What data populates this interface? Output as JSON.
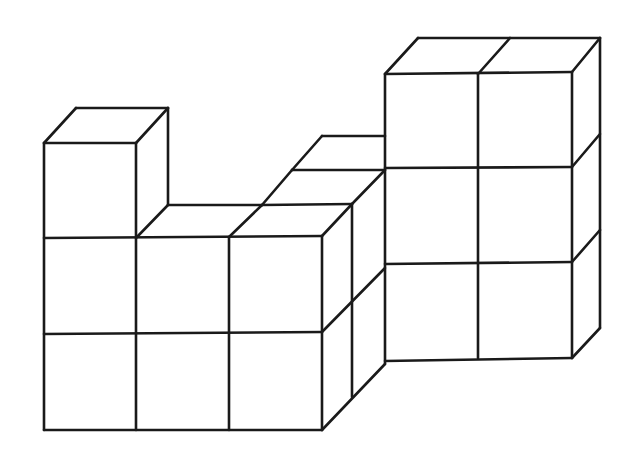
{
  "figure": {
    "stroke_color": "#1a1a1a",
    "fill_color": "#ffffff",
    "stroke_width": 2.6,
    "front_left_block": {
      "columns": 3,
      "rows": 2,
      "tower_on_left_column": 1
    },
    "middle_back_step": {
      "cubes_visible_top": 2
    },
    "right_block": {
      "columns": 2,
      "rows": 3
    }
  },
  "lines": [
    [
      44,
      143,
      44,
      430
    ],
    [
      44,
      430,
      322,
      430
    ],
    [
      44,
      143,
      136,
      143
    ],
    [
      44,
      143,
      76,
      108
    ],
    [
      76,
      108,
      168,
      108
    ],
    [
      136,
      143,
      168,
      108
    ],
    [
      168,
      108,
      168,
      205
    ],
    [
      136,
      143,
      136,
      430
    ],
    [
      44,
      238,
      322,
      236
    ],
    [
      44,
      334,
      322,
      332
    ],
    [
      136,
      238,
      168,
      205
    ],
    [
      168,
      205,
      262,
      205
    ],
    [
      229,
      237,
      229,
      430
    ],
    [
      229,
      237,
      262,
      205
    ],
    [
      262,
      205,
      292,
      170
    ],
    [
      292,
      170,
      385,
      170
    ],
    [
      292,
      170,
      322,
      136
    ],
    [
      322,
      136,
      385,
      136
    ],
    [
      262,
      205,
      352,
      204
    ],
    [
      322,
      236,
      352,
      204
    ],
    [
      352,
      204,
      385,
      170
    ],
    [
      322,
      236,
      322,
      430
    ],
    [
      352,
      204,
      352,
      397
    ],
    [
      322,
      430,
      385,
      364
    ],
    [
      322,
      332,
      385,
      268
    ],
    [
      385,
      74,
      385,
      364
    ],
    [
      385,
      74,
      418,
      38
    ],
    [
      418,
      38,
      600,
      38
    ],
    [
      478,
      74,
      510,
      38
    ],
    [
      385,
      74,
      572,
      72
    ],
    [
      478,
      74,
      478,
      358
    ],
    [
      572,
      72,
      572,
      358
    ],
    [
      600,
      38,
      600,
      328
    ],
    [
      572,
      72,
      600,
      38
    ],
    [
      385,
      168,
      572,
      167
    ],
    [
      572,
      167,
      600,
      134
    ],
    [
      385,
      264,
      572,
      262
    ],
    [
      572,
      262,
      600,
      230
    ],
    [
      385,
      361,
      572,
      358
    ],
    [
      572,
      358,
      600,
      328
    ]
  ]
}
